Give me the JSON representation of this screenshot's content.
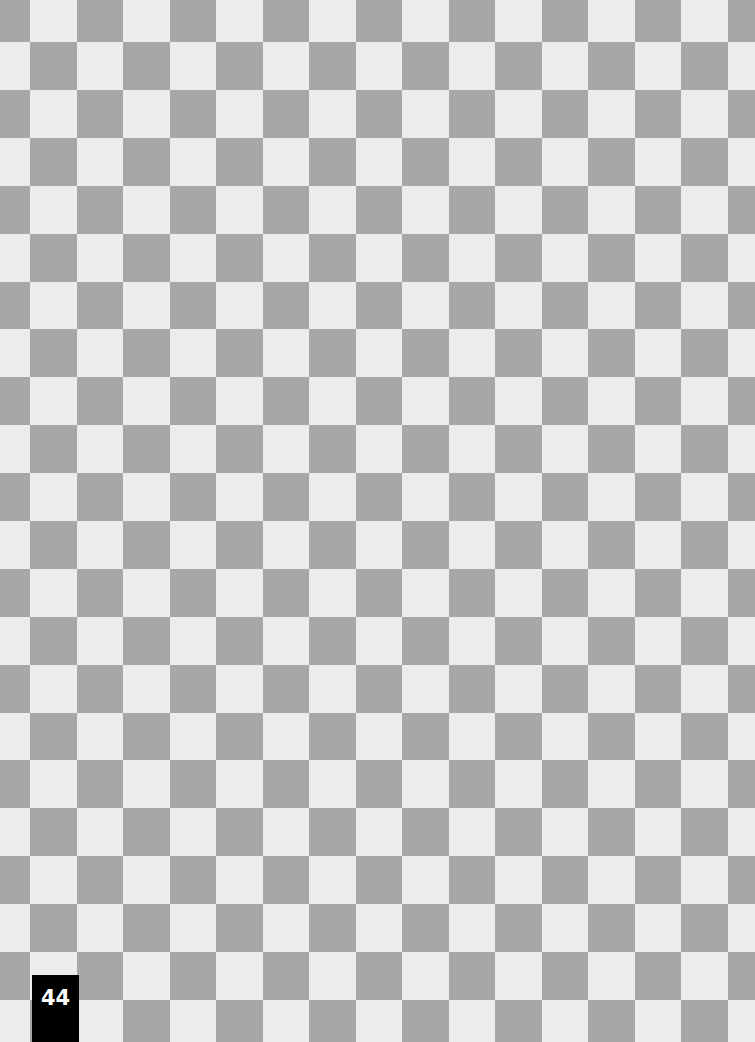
{
  "page": {
    "page_number": "44"
  },
  "pattern": {
    "type": "checkerboard",
    "dark_color": "#a7a7a7",
    "light_color": "#ececec",
    "first_col_width": 30,
    "first_row_height": 42,
    "col_width": 46.5,
    "row_height": 47.9,
    "top_left_dark": true
  }
}
